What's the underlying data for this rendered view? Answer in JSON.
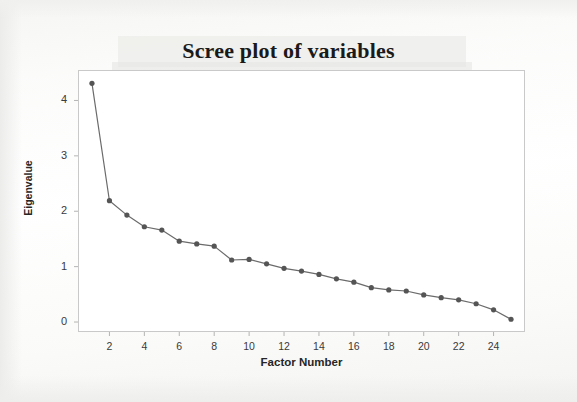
{
  "chart_data": {
    "type": "line",
    "title": "Scree plot of variables",
    "xlabel": "Factor Number",
    "ylabel": "Eigenvalue",
    "xlim": [
      0.2,
      25.8
    ],
    "ylim": [
      -0.18,
      4.55
    ],
    "grid": false,
    "legend": null,
    "marker": "filled-circle",
    "line_color": "#6b6b6b",
    "marker_color": "#555555",
    "x": [
      1,
      2,
      3,
      4,
      5,
      6,
      7,
      8,
      9,
      10,
      11,
      12,
      13,
      14,
      15,
      16,
      17,
      18,
      19,
      20,
      21,
      22,
      23,
      24,
      25
    ],
    "values": [
      4.31,
      2.19,
      1.93,
      1.72,
      1.66,
      1.46,
      1.41,
      1.37,
      1.12,
      1.13,
      1.05,
      0.97,
      0.92,
      0.86,
      0.78,
      0.72,
      0.62,
      0.58,
      0.56,
      0.49,
      0.44,
      0.4,
      0.33,
      0.22,
      0.05
    ],
    "xticks": [
      2,
      4,
      6,
      8,
      10,
      12,
      14,
      16,
      18,
      20,
      22,
      24
    ],
    "yticks": [
      0,
      1,
      2,
      3,
      4
    ],
    "xtick_labels": [
      "2",
      "4",
      "6",
      "8",
      "10",
      "12",
      "14",
      "16",
      "18",
      "20",
      "22",
      "24"
    ],
    "ytick_labels": [
      "0",
      "1",
      "2",
      "3",
      "4"
    ]
  }
}
